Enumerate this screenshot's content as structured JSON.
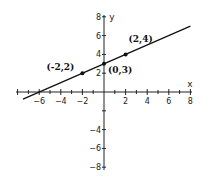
{
  "chart_data": {
    "type": "line",
    "title": "",
    "xlabel": "x",
    "ylabel": "y",
    "xlim": [
      -8,
      8
    ],
    "ylim": [
      -8,
      8
    ],
    "grid": false,
    "x_ticks": [
      -6,
      -4,
      -2,
      2,
      4,
      6,
      8
    ],
    "y_ticks": [
      8,
      6,
      4,
      2,
      -4,
      -6,
      -8
    ],
    "series": [
      {
        "name": "y = x/2 + 3",
        "slope": 0.5,
        "intercept": 3,
        "x_range": [
          -7.5,
          8
        ]
      }
    ],
    "points": [
      {
        "x": -2,
        "y": 2,
        "label": "(-2,2)"
      },
      {
        "x": 0,
        "y": 3,
        "label": "(0,3)"
      },
      {
        "x": 2,
        "y": 4,
        "label": "(2,4)"
      }
    ]
  }
}
